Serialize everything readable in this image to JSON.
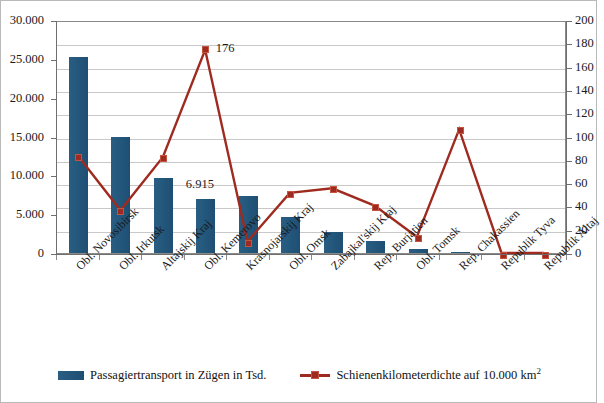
{
  "chart_data": {
    "type": "bar",
    "title": "",
    "xlabel": "",
    "ylabel": "",
    "grid": true,
    "legend_position": "bottom",
    "categories": [
      "Obl. Novosibirsk",
      "Obl. Irkutsk",
      "Altajskij Kraj",
      "Obl. Kemerovo",
      "Krasnojarskij Kraj",
      "Obl. Omsk",
      "Zabajkal'skij Kraj",
      "Rep. Burjatien",
      "Obl. Tomsk",
      "Rep. Chakassien",
      "Republik Tyva",
      "Republik Altaj"
    ],
    "series": [
      {
        "name": "Passagiertransport in Zügen in Tsd.",
        "type": "bar",
        "axis": "left",
        "color": "#1f5378",
        "values": [
          25300,
          15000,
          9600,
          6915,
          7300,
          4600,
          2700,
          1500,
          550,
          180,
          0,
          0
        ]
      },
      {
        "name": "Schienenkilometerdichte auf 10.000 km²",
        "type": "line",
        "axis": "right",
        "color": "#9e2a20",
        "values": [
          84,
          37,
          83,
          176,
          10,
          52,
          56,
          41,
          14,
          107,
          0,
          0
        ]
      }
    ],
    "annotations": [
      {
        "text": "176",
        "series": "Schienenkilometerdichte auf 10.000 km²",
        "category": "Obl. Kemerovo"
      },
      {
        "text": "6.915",
        "series": "Passagiertransport in Zügen in Tsd.",
        "category": "Obl. Kemerovo"
      }
    ],
    "y_left": {
      "min": 0,
      "max": 30000,
      "step": 5000,
      "ticks": [
        "0",
        "5.000",
        "10.000",
        "15.000",
        "20.000",
        "25.000",
        "30.000"
      ]
    },
    "y_right": {
      "min": 0,
      "max": 200,
      "step": 20,
      "ticks": [
        "0",
        "20",
        "40",
        "60",
        "80",
        "100",
        "120",
        "140",
        "160",
        "180",
        "200"
      ]
    }
  },
  "legend": {
    "items": [
      {
        "label": "Passagiertransport in Zügen in Tsd.",
        "marker": "bar-swatch",
        "color": "#1f5378"
      },
      {
        "label": "Schienenkilometerdichte auf 10.000 km",
        "suffix": "2",
        "marker": "line-swatch",
        "color": "#9e2a20"
      }
    ]
  }
}
